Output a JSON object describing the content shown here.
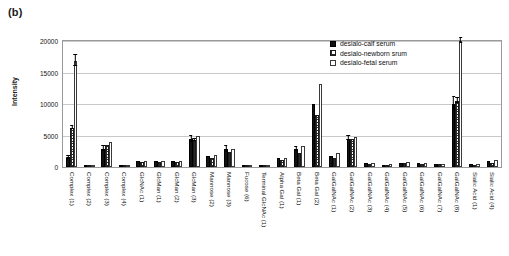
{
  "panel": {
    "label": "(b)"
  },
  "legend": {
    "position": "inside-top-right",
    "items": [
      {
        "name": "desialo-calf serum",
        "swatch": "solid-black"
      },
      {
        "name": "desialo-newborn srum",
        "swatch": "checkered"
      },
      {
        "name": "desialo-fetal serum",
        "swatch": "white-open"
      }
    ]
  },
  "axes": {
    "ylabel": "Intensity",
    "yticks": [
      0,
      5000,
      10000,
      15000,
      20000
    ],
    "ytick_labels": [
      "0",
      "5000",
      "10000",
      "15000",
      "20000"
    ],
    "ylim": [
      0,
      20000
    ],
    "xlabel": ""
  },
  "chart_data": {
    "type": "bar",
    "title": "",
    "xlabel": "",
    "ylabel": "Intensity",
    "ylim": [
      0,
      20000
    ],
    "grid": true,
    "legend_position": "inside-top-right",
    "categories": [
      "Complex (1)",
      "Complex (2)",
      "Complex (3)",
      "Complex (4)",
      "GlcNAc (1)",
      "GlcMan (1)",
      "GlcMan (2)",
      "GlcMan (3)",
      "Mannose (2)",
      "Mannose (3)",
      "Fucose (6)",
      "Terminal GlcNAc (1)",
      "Alpha Gal (1)",
      "Beta Gal (1)",
      "Beta Gal (2)",
      "GalGalNAc (1)",
      "GalGalNAc (2)",
      "GalGalNAc (3)",
      "GalGalNAc (4)",
      "GalGalNAc (5)",
      "GalGalNAc (6)",
      "GalGalNAc (7)",
      "GalGalNAc (8)",
      "Sialic Acid (1)",
      "Sialic Acid (4)"
    ],
    "series": [
      {
        "name": "desialo-calf serum",
        "swatch": "solid-black",
        "values": [
          1500,
          250,
          2900,
          200,
          900,
          1000,
          900,
          4400,
          1800,
          2800,
          300,
          150,
          1400,
          2800,
          10000,
          1700,
          4500,
          600,
          350,
          700,
          600,
          500,
          10000,
          400,
          900
        ],
        "errors": [
          250,
          0,
          500,
          0,
          0,
          0,
          0,
          600,
          0,
          500,
          0,
          0,
          0,
          350,
          0,
          0,
          400,
          0,
          0,
          0,
          0,
          0,
          1100,
          0,
          0
        ]
      },
      {
        "name": "desialo-newborn srum",
        "swatch": "checkered",
        "values": [
          6200,
          200,
          3500,
          150,
          800,
          800,
          800,
          4200,
          1500,
          2400,
          250,
          120,
          1100,
          2300,
          8300,
          1400,
          4400,
          500,
          300,
          600,
          500,
          420,
          10500,
          300,
          700
        ],
        "errors": [
          350,
          0,
          0,
          0,
          0,
          0,
          0,
          300,
          0,
          0,
          0,
          0,
          0,
          0,
          0,
          0,
          0,
          0,
          0,
          0,
          0,
          0,
          500,
          0,
          0
        ]
      },
      {
        "name": "desialo-fetal serum",
        "swatch": "white-open",
        "values": [
          16800,
          300,
          4000,
          250,
          950,
          1000,
          1000,
          4900,
          1900,
          2900,
          350,
          150,
          1500,
          3300,
          13200,
          2200,
          4700,
          700,
          400,
          800,
          650,
          550,
          20000,
          450,
          1100
        ],
        "errors": [
          1000,
          0,
          0,
          0,
          0,
          0,
          0,
          0,
          0,
          0,
          0,
          0,
          0,
          0,
          0,
          0,
          0,
          0,
          0,
          0,
          0,
          0,
          500,
          0,
          0
        ]
      }
    ]
  }
}
